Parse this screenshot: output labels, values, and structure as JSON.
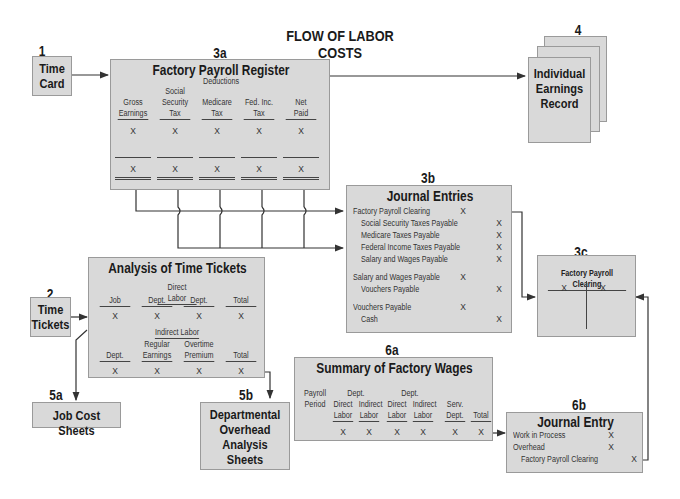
{
  "title": "FLOW OF LABOR COSTS",
  "nodes": {
    "time_card": {
      "num": "1",
      "label_lines": [
        "Time",
        "Card"
      ]
    },
    "payroll_register": {
      "num": "3a",
      "title": "Factory Payroll Register",
      "deductions_label": "Deductions",
      "columns": [
        {
          "lines": [
            "",
            "Gross",
            "Earnings"
          ]
        },
        {
          "lines": [
            "Social",
            "Security",
            "Tax"
          ]
        },
        {
          "lines": [
            "",
            "Medicare",
            "Tax"
          ]
        },
        {
          "lines": [
            "",
            "Fed. Inc.",
            "Tax"
          ]
        },
        {
          "lines": [
            "",
            "Net",
            "Paid"
          ]
        }
      ],
      "mark": "X"
    },
    "earnings_record": {
      "num": "4",
      "label_lines": [
        "Individual",
        "Earnings",
        "Record"
      ]
    },
    "journal_entries": {
      "num": "3b",
      "title": "Journal Entries",
      "entries": [
        {
          "account": "Factory Payroll Clearing",
          "debit": "X",
          "credit": "",
          "indent": false
        },
        {
          "account": "Social Security Taxes Payable",
          "debit": "",
          "credit": "X",
          "indent": true
        },
        {
          "account": "Medicare Taxes Payable",
          "debit": "",
          "credit": "X",
          "indent": true
        },
        {
          "account": "Federal Income Taxes Payable",
          "debit": "",
          "credit": "X",
          "indent": true
        },
        {
          "account": "Salary and Wages Payable",
          "debit": "",
          "credit": "X",
          "indent": true
        },
        {
          "account": "Salary and Wages Payable",
          "debit": "X",
          "credit": "",
          "indent": false
        },
        {
          "account": "Vouchers Payable",
          "debit": "",
          "credit": "X",
          "indent": true
        },
        {
          "account": "Vouchers Payable",
          "debit": "X",
          "credit": "",
          "indent": false
        },
        {
          "account": "Cash",
          "debit": "",
          "credit": "X",
          "indent": true
        }
      ]
    },
    "payroll_clearing": {
      "num": "3c",
      "title": "Factory Payroll Clearing",
      "debit": "X",
      "credit": "X"
    },
    "time_tickets": {
      "num": "2",
      "label_lines": [
        "Time",
        "Tickets"
      ]
    },
    "analysis_time_tickets": {
      "title": "Analysis of Time Tickets",
      "direct_label": "Direct Labor",
      "direct_columns": [
        "Job",
        "Dept.",
        "Dept.",
        "Total"
      ],
      "indirect_label": "Indirect Labor",
      "indirect_columns": [
        {
          "lines": [
            "",
            "Dept."
          ]
        },
        {
          "lines": [
            "Regular",
            "Earnings"
          ]
        },
        {
          "lines": [
            "Overtime",
            "Premium"
          ]
        },
        {
          "lines": [
            "",
            "Total"
          ]
        }
      ],
      "mark": "X"
    },
    "job_cost_sheets": {
      "num": "5a",
      "label": "Job Cost Sheets"
    },
    "dept_overhead": {
      "num": "5b",
      "label_lines": [
        "Departmental",
        "Overhead",
        "Analysis",
        "Sheets"
      ]
    },
    "summary_wages": {
      "num": "6a",
      "title": "Summary of Factory Wages",
      "payroll_period_lines": [
        "Payroll",
        "Period"
      ],
      "dept_label": "Dept.",
      "columns": [
        {
          "lines": [
            "Direct",
            "Labor"
          ]
        },
        {
          "lines": [
            "Indirect",
            "Labor"
          ]
        },
        {
          "lines": [
            "Direct",
            "Labor"
          ]
        },
        {
          "lines": [
            "Indirect",
            "Labor"
          ]
        },
        {
          "lines": [
            "Serv.",
            "Dept."
          ]
        },
        {
          "lines": [
            "",
            "Total"
          ]
        }
      ],
      "mark": "X"
    },
    "journal_entry": {
      "num": "6b",
      "title": "Journal Entry",
      "entries": [
        {
          "account": "Work in Process",
          "debit": "X",
          "credit": "",
          "indent": false
        },
        {
          "account": "Overhead",
          "debit": "X",
          "credit": "",
          "indent": false
        },
        {
          "account": "Factory Payroll Clearing",
          "debit": "",
          "credit": "X",
          "indent": true
        }
      ]
    }
  },
  "colors": {
    "box_fill": "#d9d9d9",
    "box_border": "#9a9a9a",
    "line": "#333333"
  }
}
